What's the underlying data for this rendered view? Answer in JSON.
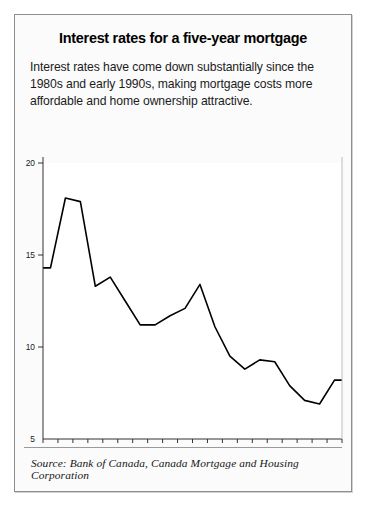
{
  "figure": {
    "title": "Interest rates for a five-year mortgage",
    "subtitle": "Interest rates have come down substantially since the 1980s and early 1990s, making mortgage costs more affordable and home ownership attractive.",
    "source": "Source: Bank of Canada, Canada Mortgage and Housing Corporation"
  },
  "colors": {
    "band_light": "#e3e3e3",
    "band_dark": "#adadad",
    "line": "#000000",
    "frame": "#8e8e8e",
    "axis": "#333333",
    "background": "#fbfbfb",
    "plot_background": "#ffffff"
  },
  "chart_data": {
    "type": "area",
    "title": "Interest rates for a five-year mortgage",
    "subtitle": "Interest rates have come down substantially since the 1980s and early 1990s, making mortgage costs more affordable and home ownership attractive.",
    "xlabel": "",
    "ylabel": "",
    "ylim": [
      5,
      20
    ],
    "yticks": [
      5,
      10,
      15,
      20
    ],
    "ytick_labels": [
      "5",
      "10",
      "15",
      "20"
    ],
    "grid": false,
    "legend": null,
    "categories": [
      1980,
      1981,
      1982,
      1983,
      1984,
      1985,
      1986,
      1987,
      1988,
      1989,
      1990,
      1991,
      1992,
      1993,
      1994,
      1995,
      1996,
      1997,
      1998,
      1999
    ],
    "xtick_labels": [
      "1980",
      "81",
      "82",
      "83",
      "84",
      "85",
      "86",
      "87",
      "88",
      "89",
      "90",
      "91",
      "92",
      "93",
      "94",
      "95",
      "96",
      "97",
      "98",
      "99"
    ],
    "values": [
      14.3,
      18.1,
      17.9,
      13.3,
      13.8,
      12.5,
      11.2,
      11.2,
      11.7,
      12.1,
      13.4,
      11.1,
      9.5,
      8.8,
      9.3,
      9.2,
      7.9,
      7.1,
      6.9,
      8.2
    ],
    "series": [
      {
        "name": "Five-year mortgage rate",
        "values": [
          14.3,
          18.1,
          17.9,
          13.3,
          13.8,
          12.5,
          11.2,
          11.2,
          11.7,
          12.1,
          13.4,
          11.1,
          9.5,
          8.8,
          9.3,
          9.2,
          7.9,
          7.1,
          6.9,
          8.2
        ]
      }
    ],
    "source": "Source: Bank of Canada, Canada Mortgage and Housing Corporation"
  }
}
